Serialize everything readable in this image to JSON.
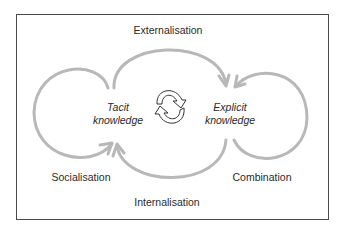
{
  "diagram": {
    "type": "SECI knowledge conversion cycle",
    "nodes": {
      "tacit": {
        "line1": "Tacit",
        "line2": "knowledge"
      },
      "explicit": {
        "line1": "Explicit",
        "line2": "knowledge"
      }
    },
    "processes": {
      "externalisation": "Externalisation",
      "socialisation": "Socialisation",
      "combination": "Combination",
      "internalisation": "Internalisation"
    },
    "center_icon": "cycle-arrows-icon",
    "colors": {
      "arrow": "#b8b8b8",
      "frame": "#4a4a4a",
      "text": "#2a2a2a"
    }
  }
}
